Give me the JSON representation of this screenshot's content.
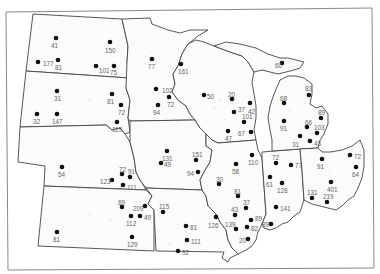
{
  "map": {
    "type": "dot-distribution",
    "region": "Midwestern United States",
    "dot_color": "#111111",
    "label_color": "#666666",
    "border_color": "#444444",
    "points": [
      {
        "state": "North Dakota",
        "label": "41",
        "x": 56,
        "y": 38,
        "lx": 51,
        "ly": 46
      },
      {
        "state": "North Dakota",
        "label": "150",
        "x": 110,
        "y": 42,
        "lx": 105,
        "ly": 51
      },
      {
        "state": "North Dakota",
        "label": "177",
        "x": 38,
        "y": 62,
        "lx": 43,
        "ly": 64
      },
      {
        "state": "North Dakota",
        "label": "81",
        "x": 58,
        "y": 60,
        "lx": 55,
        "ly": 68
      },
      {
        "state": "North Dakota",
        "label": "101",
        "x": 96,
        "y": 66,
        "lx": 99,
        "ly": 71
      },
      {
        "state": "North Dakota",
        "label": "75",
        "x": 114,
        "y": 66,
        "lx": 110,
        "ly": 73
      },
      {
        "state": "South Dakota",
        "label": "31",
        "x": 57,
        "y": 91,
        "lx": 54,
        "ly": 99
      },
      {
        "state": "South Dakota",
        "label": "81",
        "x": 112,
        "y": 94,
        "lx": 107,
        "ly": 102
      },
      {
        "state": "South Dakota",
        "label": "72",
        "x": 121,
        "y": 105,
        "lx": 118,
        "ly": 113
      },
      {
        "state": "South Dakota",
        "label": "32",
        "x": 37,
        "y": 114,
        "lx": 33,
        "ly": 122
      },
      {
        "state": "South Dakota",
        "label": "147",
        "x": 57,
        "y": 114,
        "lx": 52,
        "ly": 122
      },
      {
        "state": "South Dakota",
        "label": "119",
        "x": 117,
        "y": 122,
        "lx": 112,
        "ly": 130
      },
      {
        "state": "Nebraska",
        "label": "54",
        "x": 62,
        "y": 167,
        "lx": 58,
        "ly": 175
      },
      {
        "state": "Nebraska",
        "label": "72",
        "x": 122,
        "y": 174,
        "lx": 119,
        "ly": 170
      },
      {
        "state": "Nebraska",
        "label": "91",
        "x": 130,
        "y": 177,
        "lx": 128,
        "ly": 172
      },
      {
        "state": "Nebraska",
        "label": "123",
        "x": 112,
        "y": 180,
        "lx": 100,
        "ly": 182
      },
      {
        "state": "Nebraska",
        "label": "111",
        "x": 123,
        "y": 185,
        "lx": 127,
        "ly": 188
      },
      {
        "state": "Kansas",
        "label": "69",
        "x": 122,
        "y": 207,
        "lx": 118,
        "ly": 203
      },
      {
        "state": "Kansas",
        "label": "209",
        "x": 145,
        "y": 206,
        "lx": 133,
        "ly": 209
      },
      {
        "state": "Kansas",
        "label": "112",
        "x": 131,
        "y": 216,
        "lx": 126,
        "ly": 224
      },
      {
        "state": "Kansas",
        "label": "49",
        "x": 140,
        "y": 216,
        "lx": 144,
        "ly": 218
      },
      {
        "state": "Kansas",
        "label": "81",
        "x": 57,
        "y": 232,
        "lx": 53,
        "ly": 240
      },
      {
        "state": "Kansas",
        "label": "129",
        "x": 132,
        "y": 237,
        "lx": 127,
        "ly": 245
      },
      {
        "state": "Minnesota",
        "label": "77",
        "x": 152,
        "y": 59,
        "lx": 148,
        "ly": 67
      },
      {
        "state": "Minnesota",
        "label": "161",
        "x": 181,
        "y": 64,
        "lx": 178,
        "ly": 72
      },
      {
        "state": "Minnesota",
        "label": "102",
        "x": 156,
        "y": 89,
        "lx": 162,
        "ly": 91
      },
      {
        "state": "Minnesota",
        "label": "72",
        "x": 169,
        "y": 97,
        "lx": 167,
        "ly": 105
      },
      {
        "state": "Minnesota",
        "label": "94",
        "x": 158,
        "y": 105,
        "lx": 153,
        "ly": 113
      },
      {
        "state": "Iowa",
        "label": "131",
        "x": 167,
        "y": 151,
        "lx": 162,
        "ly": 159
      },
      {
        "state": "Iowa",
        "label": "49",
        "x": 161,
        "y": 163,
        "lx": 164,
        "ly": 165
      },
      {
        "state": "Iowa",
        "label": "151",
        "x": 196,
        "y": 160,
        "lx": 192,
        "ly": 155
      },
      {
        "state": "Iowa",
        "label": "94",
        "x": 198,
        "y": 172,
        "lx": 187,
        "ly": 174
      },
      {
        "state": "Missouri",
        "label": "115",
        "x": 163,
        "y": 212,
        "lx": 159,
        "ly": 207
      },
      {
        "state": "Missouri",
        "label": "81",
        "x": 186,
        "y": 226,
        "lx": 190,
        "ly": 228
      },
      {
        "state": "Missouri",
        "label": "126",
        "x": 216,
        "y": 217,
        "lx": 208,
        "ly": 226
      },
      {
        "state": "Missouri",
        "label": "111",
        "x": 187,
        "y": 240,
        "lx": 191,
        "ly": 242
      },
      {
        "state": "Missouri",
        "label": "92",
        "x": 178,
        "y": 251,
        "lx": 182,
        "ly": 253
      },
      {
        "state": "Wisconsin",
        "label": "50",
        "x": 204,
        "y": 95,
        "lx": 207,
        "ly": 97
      },
      {
        "state": "Wisconsin",
        "label": "20",
        "x": 232,
        "y": 99,
        "lx": 228,
        "ly": 95
      },
      {
        "state": "Wisconsin",
        "label": "37",
        "x": 234,
        "y": 112,
        "lx": 238,
        "ly": 110
      },
      {
        "state": "Wisconsin",
        "label": "42",
        "x": 250,
        "y": 103,
        "lx": 248,
        "ly": 112
      },
      {
        "state": "Wisconsin",
        "label": "101",
        "x": 244,
        "y": 122,
        "lx": 242,
        "ly": 117
      },
      {
        "state": "Wisconsin",
        "label": "47",
        "x": 228,
        "y": 131,
        "lx": 225,
        "ly": 139
      },
      {
        "state": "Wisconsin",
        "label": "67",
        "x": 251,
        "y": 132,
        "lx": 238,
        "ly": 134
      },
      {
        "state": "Illinois",
        "label": "110",
        "x": 252,
        "y": 155,
        "lx": 248,
        "ly": 163
      },
      {
        "state": "Illinois",
        "label": "58",
        "x": 236,
        "y": 164,
        "lx": 232,
        "ly": 172
      },
      {
        "state": "Illinois",
        "label": "30",
        "x": 219,
        "y": 184,
        "lx": 216,
        "ly": 180
      },
      {
        "state": "Illinois",
        "label": "81",
        "x": 238,
        "y": 196,
        "lx": 234,
        "ly": 192
      },
      {
        "state": "Illinois",
        "label": "37",
        "x": 246,
        "y": 208,
        "lx": 243,
        "ly": 203
      },
      {
        "state": "Illinois",
        "label": "43",
        "x": 235,
        "y": 215,
        "lx": 231,
        "ly": 210
      },
      {
        "state": "Illinois",
        "label": "89",
        "x": 251,
        "y": 220,
        "lx": 255,
        "ly": 219
      },
      {
        "state": "Illinois",
        "label": "139",
        "x": 236,
        "y": 229,
        "lx": 225,
        "ly": 225
      },
      {
        "state": "Illinois",
        "label": "82",
        "x": 247,
        "y": 227,
        "lx": 251,
        "ly": 229
      },
      {
        "state": "Illinois",
        "label": "20",
        "x": 248,
        "y": 239,
        "lx": 239,
        "ly": 241
      },
      {
        "state": "Michigan",
        "label": "60",
        "x": 282,
        "y": 63,
        "lx": 275,
        "ly": 66
      },
      {
        "state": "Michigan",
        "label": "83",
        "x": 309,
        "y": 95,
        "lx": 305,
        "ly": 89
      },
      {
        "state": "Michigan",
        "label": "68",
        "x": 284,
        "y": 103,
        "lx": 280,
        "ly": 99
      },
      {
        "state": "Michigan",
        "label": "89",
        "x": 321,
        "y": 118,
        "lx": 318,
        "ly": 113
      },
      {
        "state": "Michigan",
        "label": "91",
        "x": 284,
        "y": 121,
        "lx": 280,
        "ly": 129
      },
      {
        "state": "Michigan",
        "label": "66",
        "x": 307,
        "y": 127,
        "lx": 305,
        "ly": 123
      },
      {
        "state": "Michigan",
        "label": "103",
        "x": 317,
        "y": 133,
        "lx": 314,
        "ly": 128
      },
      {
        "state": "Michigan",
        "label": "31",
        "x": 300,
        "y": 136,
        "lx": 292,
        "ly": 145
      },
      {
        "state": "Michigan",
        "label": "43",
        "x": 310,
        "y": 141,
        "lx": 314,
        "ly": 144
      },
      {
        "state": "Indiana",
        "label": "72",
        "x": 276,
        "y": 163,
        "lx": 272,
        "ly": 158
      },
      {
        "state": "Indiana",
        "label": "77",
        "x": 291,
        "y": 165,
        "lx": 295,
        "ly": 166
      },
      {
        "state": "Indiana",
        "label": "61",
        "x": 270,
        "y": 177,
        "lx": 266,
        "ly": 185
      },
      {
        "state": "Indiana",
        "label": "128",
        "x": 282,
        "y": 183,
        "lx": 277,
        "ly": 191
      },
      {
        "state": "Indiana",
        "label": "141",
        "x": 276,
        "y": 207,
        "lx": 280,
        "ly": 209
      },
      {
        "state": "Indiana",
        "label": "89",
        "x": 271,
        "y": 224,
        "lx": 262,
        "ly": 225
      },
      {
        "state": "Ohio",
        "label": "91",
        "x": 322,
        "y": 159,
        "lx": 317,
        "ly": 167
      },
      {
        "state": "Ohio",
        "label": "72",
        "x": 350,
        "y": 155,
        "lx": 354,
        "ly": 157
      },
      {
        "state": "Ohio",
        "label": "64",
        "x": 356,
        "y": 167,
        "lx": 352,
        "ly": 175
      },
      {
        "state": "Ohio",
        "label": "401",
        "x": 331,
        "y": 182,
        "lx": 327,
        "ly": 190
      },
      {
        "state": "Ohio",
        "label": "131",
        "x": 312,
        "y": 198,
        "lx": 307,
        "ly": 193
      },
      {
        "state": "Ohio",
        "label": "219",
        "x": 327,
        "y": 202,
        "lx": 323,
        "ly": 197
      }
    ]
  }
}
